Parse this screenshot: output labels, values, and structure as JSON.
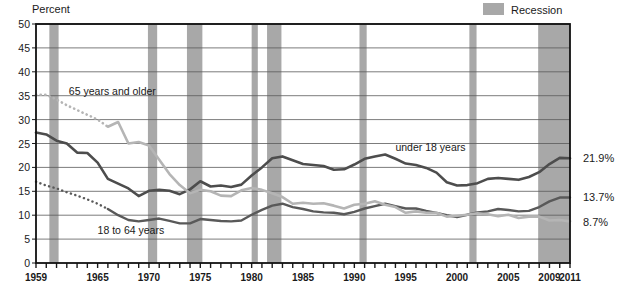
{
  "chart_data": {
    "type": "line",
    "title": "",
    "ylabel": "Percent",
    "xlabel": "",
    "ylim": [
      0,
      50
    ],
    "xlim": [
      1959,
      2011
    ],
    "yticks": [
      0,
      5,
      10,
      15,
      20,
      25,
      30,
      35,
      40,
      45,
      50
    ],
    "xticks_labeled": [
      1959,
      1965,
      1970,
      1975,
      1980,
      1985,
      1990,
      1995,
      2000,
      2005,
      2009,
      2011
    ],
    "grid": "horizontal",
    "legend_position": "top-right",
    "legend": [
      {
        "label": "Recession",
        "color": "#a8a8a8",
        "swatch": "band"
      }
    ],
    "annotations": [
      {
        "text": "65 years and older",
        "x": 1962.2,
        "y": 36.0
      },
      {
        "text": "18 to 64 years",
        "x": 1965.0,
        "y": 7.0
      },
      {
        "text": "under 18 years",
        "x": 1994.0,
        "y": 24.2
      }
    ],
    "end_labels": [
      {
        "text": "21.9%",
        "series": "under 18 years",
        "value": 21.9
      },
      {
        "text": "13.7%",
        "series": "18 to 64 years",
        "value": 13.7
      },
      {
        "text": "8.7%",
        "series": "65 years and older",
        "value": 8.7
      }
    ],
    "recessions": [
      {
        "start": 1960.3,
        "end": 1961.2
      },
      {
        "start": 1969.9,
        "end": 1970.8
      },
      {
        "start": 1973.7,
        "end": 1975.2
      },
      {
        "start": 1980.0,
        "end": 1980.6
      },
      {
        "start": 1981.5,
        "end": 1982.9
      },
      {
        "start": 1990.5,
        "end": 1991.2
      },
      {
        "start": 2001.2,
        "end": 2001.9
      },
      {
        "start": 2007.9,
        "end": 2011.0
      }
    ],
    "series": [
      {
        "name": "under 18 years",
        "color": "#4d4d4d",
        "width": 2.6,
        "x": [
          1959,
          1960,
          1961,
          1962,
          1963,
          1964,
          1965,
          1966,
          1967,
          1968,
          1969,
          1970,
          1971,
          1972,
          1973,
          1974,
          1975,
          1976,
          1977,
          1978,
          1979,
          1980,
          1981,
          1982,
          1983,
          1984,
          1985,
          1986,
          1987,
          1988,
          1989,
          1990,
          1991,
          1992,
          1993,
          1994,
          1995,
          1996,
          1997,
          1998,
          1999,
          2000,
          2001,
          2002,
          2003,
          2004,
          2005,
          2006,
          2007,
          2008,
          2009,
          2010,
          2011
        ],
        "values": [
          27.3,
          26.9,
          25.6,
          25.0,
          23.1,
          23.0,
          21.0,
          17.6,
          16.6,
          15.6,
          14.0,
          15.1,
          15.3,
          15.1,
          14.4,
          15.4,
          17.1,
          16.0,
          16.2,
          15.9,
          16.4,
          18.3,
          20.0,
          21.9,
          22.3,
          21.5,
          20.7,
          20.5,
          20.3,
          19.5,
          19.6,
          20.6,
          21.8,
          22.3,
          22.7,
          21.8,
          20.8,
          20.5,
          19.9,
          18.9,
          16.9,
          16.2,
          16.3,
          16.7,
          17.6,
          17.8,
          17.6,
          17.4,
          18.0,
          19.0,
          20.7,
          22.0,
          21.9
        ]
      },
      {
        "name": "18 to 64 years",
        "color": "#595959",
        "width": 2.4,
        "dotted_until": 1966,
        "x": [
          1959,
          1960,
          1961,
          1962,
          1963,
          1964,
          1965,
          1966,
          1967,
          1968,
          1969,
          1970,
          1971,
          1972,
          1973,
          1974,
          1975,
          1976,
          1977,
          1978,
          1979,
          1980,
          1981,
          1982,
          1983,
          1984,
          1985,
          1986,
          1987,
          1988,
          1989,
          1990,
          1991,
          1992,
          1993,
          1994,
          1995,
          1996,
          1997,
          1998,
          1999,
          2000,
          2001,
          2002,
          2003,
          2004,
          2005,
          2006,
          2007,
          2008,
          2009,
          2010,
          2011
        ],
        "values": [
          17.0,
          16.2,
          15.6,
          14.8,
          14.1,
          13.3,
          12.4,
          11.3,
          10.0,
          9.0,
          8.7,
          9.0,
          9.3,
          8.8,
          8.3,
          8.3,
          9.2,
          9.0,
          8.8,
          8.7,
          8.9,
          10.1,
          11.1,
          12.0,
          12.4,
          11.7,
          11.3,
          10.8,
          10.6,
          10.5,
          10.2,
          10.7,
          11.4,
          11.9,
          12.4,
          11.9,
          11.4,
          11.4,
          10.9,
          10.5,
          10.0,
          9.6,
          10.1,
          10.6,
          10.8,
          11.3,
          11.1,
          10.8,
          10.9,
          11.7,
          12.9,
          13.7,
          13.7
        ]
      },
      {
        "name": "65 years and older",
        "color": "#b5b5b5",
        "width": 2.6,
        "dotted_until": 1966,
        "x": [
          1959,
          1960,
          1961,
          1962,
          1963,
          1964,
          1965,
          1966,
          1967,
          1968,
          1969,
          1970,
          1971,
          1972,
          1973,
          1974,
          1975,
          1976,
          1977,
          1978,
          1979,
          1980,
          1981,
          1982,
          1983,
          1984,
          1985,
          1986,
          1987,
          1988,
          1989,
          1990,
          1991,
          1992,
          1993,
          1994,
          1995,
          1996,
          1997,
          1998,
          1999,
          2000,
          2001,
          2002,
          2003,
          2004,
          2005,
          2006,
          2007,
          2008,
          2009,
          2010,
          2011
        ],
        "values": [
          35.2,
          35.2,
          34.2,
          33.0,
          32.0,
          31.0,
          30.0,
          28.5,
          29.5,
          25.0,
          25.3,
          24.6,
          21.6,
          18.6,
          16.3,
          14.6,
          15.3,
          15.0,
          14.1,
          14.0,
          15.2,
          15.7,
          15.3,
          14.6,
          13.8,
          12.4,
          12.6,
          12.4,
          12.5,
          12.0,
          11.4,
          12.2,
          12.4,
          12.9,
          12.2,
          11.7,
          10.5,
          10.8,
          10.5,
          10.5,
          9.7,
          9.9,
          10.1,
          10.4,
          10.2,
          9.8,
          10.1,
          9.4,
          9.7,
          9.7,
          8.9,
          9.0,
          8.7
        ]
      }
    ]
  },
  "ylabel_title": "Percent",
  "legend_label": "Recession"
}
